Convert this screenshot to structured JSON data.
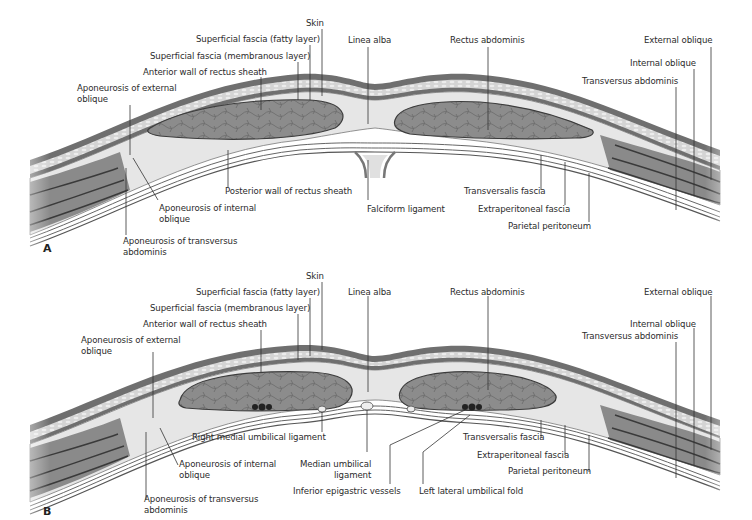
{
  "figure": {
    "panels": [
      {
        "id": "A",
        "letter": "A",
        "labels": {
          "skin": "Skin",
          "sf_fatty": "Superficial fascia (fatty layer)",
          "sf_membranous": "Superficial fascia (membranous layer)",
          "anterior_wall": "Anterior wall of rectus sheath",
          "apo_ext_oblique": "Aponeurosis of external\noblique",
          "linea_alba": "Linea alba",
          "rectus": "Rectus abdominis",
          "external_oblique": "External oblique",
          "internal_oblique": "Internal oblique",
          "transversus": "Transversus abdominis",
          "posterior_wall": "Posterior wall of rectus sheath",
          "apo_int_oblique": "Aponeurosis of internal\noblique",
          "apo_transversus": "Aponeurosis of transversus\nabdominis",
          "falciform": "Falciform ligament",
          "transversalis": "Transversalis fascia",
          "extraperitoneal": "Extraperitoneal fascia",
          "parietal": "Parietal peritoneum"
        }
      },
      {
        "id": "B",
        "letter": "B",
        "labels": {
          "skin": "Skin",
          "sf_fatty": "Superficial fascia (fatty layer)",
          "sf_membranous": "Superficial fascia (membranous layer)",
          "anterior_wall": "Anterior wall of rectus sheath",
          "apo_ext_oblique": "Aponeurosis of external\noblique",
          "linea_alba": "Linea alba",
          "rectus": "Rectus abdominis",
          "external_oblique": "External oblique",
          "internal_oblique": "Internal oblique",
          "transversus": "Transversus abdominis",
          "right_medial_umb": "Right medial umbilical ligament",
          "apo_int_oblique": "Aponeurosis of internal\noblique",
          "apo_transversus": "Aponeurosis of transversus\nabdominis",
          "median_umb": "Median umbilical\nligament",
          "inf_epigastric": "Inferior epigastric vessels",
          "left_lateral_umb": "Left lateral umbilical fold",
          "transversalis": "Transversalis fascia",
          "extraperitoneal": "Extraperitoneal fascia",
          "parietal": "Parietal peritoneum"
        }
      }
    ],
    "colors": {
      "skin": "#6f6f6f",
      "fat": "#cfcfcf",
      "muscle": "#8a8a8a",
      "muscle_dark": "#5a5a5a",
      "fascia": "#e4e4e4",
      "leader": "#333333",
      "text": "#2b2b2b"
    }
  }
}
